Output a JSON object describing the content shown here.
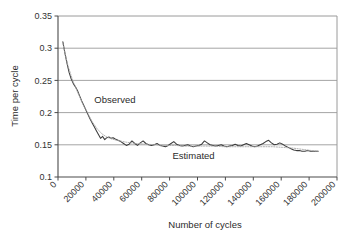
{
  "chart_data": {
    "type": "line",
    "title": "",
    "xlabel": "Number of cycles",
    "ylabel": "Time per cycle",
    "xlim": [
      0,
      200000
    ],
    "ylim": [
      0.1,
      0.35
    ],
    "grid": "horizontal",
    "legend_position": "inline-annotations",
    "x_ticks": [
      0,
      20000,
      40000,
      60000,
      80000,
      100000,
      120000,
      140000,
      160000,
      180000,
      200000
    ],
    "x_tick_labels": [
      "0",
      "20000",
      "40000",
      "60000",
      "80000",
      "100000",
      "120000",
      "140000",
      "160000",
      "180000",
      "200000"
    ],
    "y_ticks": [
      0.1,
      0.15,
      0.2,
      0.25,
      0.3,
      0.35
    ],
    "y_tick_labels": [
      "0.1",
      "0.15",
      "0.2",
      "0.25",
      "0.3",
      "0.35"
    ],
    "annotations": [
      {
        "text": "Observed",
        "x": 26000,
        "y": 0.215
      },
      {
        "text": "Estimated",
        "x": 82000,
        "y": 0.128
      }
    ],
    "series": [
      {
        "name": "Observed",
        "style": "solid",
        "color": "#3c3c3c",
        "x": [
          3500,
          5000,
          6500,
          8000,
          9500,
          11000,
          12500,
          14000,
          15500,
          17000,
          18500,
          20000,
          21500,
          23000,
          24500,
          26000,
          27500,
          29000,
          30500,
          32000,
          33500,
          35000,
          36500,
          38000,
          39500,
          41000,
          43000,
          45000,
          47000,
          49000,
          51000,
          53000,
          55000,
          57000,
          59000,
          61000,
          63000,
          65000,
          67000,
          69000,
          71000,
          73000,
          75000,
          77000,
          79000,
          81000,
          83000,
          85000,
          87000,
          89000,
          91000,
          93000,
          95000,
          97000,
          99000,
          101000,
          103000,
          105000,
          107000,
          109000,
          111000,
          113000,
          115000,
          117000,
          119000,
          121000,
          123000,
          125000,
          127000,
          129000,
          131000,
          133000,
          135000,
          137000,
          139000,
          141000,
          143000,
          145000,
          147000,
          149000,
          151000,
          153000,
          155000,
          157000,
          159000,
          161000,
          163000,
          165000,
          167000,
          169000,
          171000,
          173000,
          175000,
          177000,
          179000,
          181000,
          183000,
          185000,
          186500
        ],
        "y": [
          0.31,
          0.292,
          0.276,
          0.262,
          0.252,
          0.245,
          0.24,
          0.234,
          0.226,
          0.218,
          0.211,
          0.204,
          0.197,
          0.19,
          0.184,
          0.178,
          0.172,
          0.166,
          0.16,
          0.163,
          0.158,
          0.161,
          0.162,
          0.16,
          0.161,
          0.159,
          0.157,
          0.155,
          0.152,
          0.149,
          0.151,
          0.156,
          0.152,
          0.149,
          0.153,
          0.156,
          0.152,
          0.15,
          0.149,
          0.15,
          0.152,
          0.149,
          0.148,
          0.147,
          0.149,
          0.152,
          0.155,
          0.151,
          0.149,
          0.148,
          0.149,
          0.15,
          0.148,
          0.147,
          0.148,
          0.149,
          0.151,
          0.156,
          0.153,
          0.15,
          0.149,
          0.148,
          0.149,
          0.15,
          0.148,
          0.147,
          0.148,
          0.149,
          0.151,
          0.149,
          0.148,
          0.15,
          0.152,
          0.15,
          0.148,
          0.147,
          0.148,
          0.15,
          0.152,
          0.155,
          0.157,
          0.153,
          0.15,
          0.151,
          0.153,
          0.151,
          0.148,
          0.146,
          0.144,
          0.142,
          0.141,
          0.141,
          0.14,
          0.14,
          0.141,
          0.14,
          0.14,
          0.14,
          0.14
        ]
      },
      {
        "name": "Estimated",
        "style": "dotted",
        "color": "#a8a8a8",
        "x": [
          3500,
          7000,
          10500,
          14000,
          17500,
          21000,
          24500,
          28000,
          31500,
          35000,
          38500,
          42000,
          49000,
          56000,
          63000,
          70000,
          77000,
          84000,
          91000,
          98000,
          105000,
          112000,
          119000,
          126000,
          133000,
          140000,
          147000,
          154000,
          161000,
          168000,
          175000,
          182000,
          186500
        ],
        "y": [
          0.307,
          0.274,
          0.25,
          0.232,
          0.215,
          0.2,
          0.186,
          0.175,
          0.167,
          0.162,
          0.159,
          0.157,
          0.154,
          0.152,
          0.151,
          0.15,
          0.149,
          0.149,
          0.148,
          0.148,
          0.148,
          0.148,
          0.147,
          0.147,
          0.147,
          0.147,
          0.147,
          0.147,
          0.146,
          0.145,
          0.143,
          0.141,
          0.14
        ]
      }
    ]
  }
}
